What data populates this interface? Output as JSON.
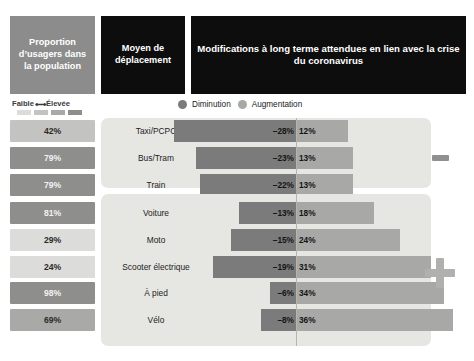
{
  "header": {
    "proportion_title": "Proportion d’usagers dans la population",
    "mode_title": "Moyen de déplacement",
    "modifications_title": "Modifications à long terme attendues en lien avec la crise du coronavirus"
  },
  "legend": {
    "scale_low": "Faible",
    "scale_arrow": "⟷",
    "scale_high": "Élevée",
    "scale_swatches": [
      "#dcdcda",
      "#c3c3c1",
      "#a9a9a7",
      "#8e8e8c"
    ],
    "series": [
      {
        "label": "Diminution",
        "color": "#7b7b7b",
        "icon": "circle-icon"
      },
      {
        "label": "Augmentation",
        "color": "#a8a8a6",
        "icon": "circle-icon"
      }
    ]
  },
  "markers": {
    "decrease_symbol": "minus-icon",
    "increase_symbol": "plus-icon"
  },
  "colors": {
    "header_proportion_bg": "#8c8c8c",
    "header_dark_bg": "#0d0d0d",
    "card_bg": "#e6e6e3",
    "negative_bar": "#7b7b7b",
    "positive_bar": "#a8a8a6",
    "axis": "#b7b4ae"
  },
  "chart_data": {
    "type": "bar",
    "title": "Modifications à long terme attendues en lien avec la crise du coronavirus",
    "xlabel": "",
    "ylabel": "Moyen de déplacement",
    "orientation": "horizontal-diverging",
    "grid": false,
    "legend_position": "top",
    "axis_center": 0,
    "units": "%",
    "series": [
      {
        "name": "Diminution",
        "color": "#7b7b7b",
        "values": [
          -28,
          -23,
          -22,
          -13,
          -15,
          -19,
          -6,
          -8
        ]
      },
      {
        "name": "Augmentation",
        "color": "#a8a8a6",
        "values": [
          12,
          13,
          13,
          18,
          24,
          31,
          34,
          36
        ]
      }
    ],
    "categories": [
      "Taxi/PCPC",
      "Bus/Tram",
      "Train",
      "Voiture",
      "Moto",
      "Scooter électrique",
      "À pied",
      "Vélo"
    ],
    "proportion_series": {
      "name": "Proportion d’usagers dans la population",
      "values": [
        42,
        79,
        79,
        81,
        29,
        24,
        98,
        69
      ]
    }
  },
  "groups": [
    {
      "id": "group-decrease-dominant",
      "rows": [
        {
          "mode": "Taxi/PCPC",
          "proportion": "42%",
          "prop_value": 42,
          "neg": "–28%",
          "neg_value": -28,
          "pos": "12%",
          "pos_value": 12
        },
        {
          "mode": "Bus/Tram",
          "proportion": "79%",
          "prop_value": 79,
          "neg": "–23%",
          "neg_value": -23,
          "pos": "13%",
          "pos_value": 13
        },
        {
          "mode": "Train",
          "proportion": "79%",
          "prop_value": 79,
          "neg": "–22%",
          "neg_value": -22,
          "pos": "13%",
          "pos_value": 13
        }
      ]
    },
    {
      "id": "group-increase-dominant",
      "rows": [
        {
          "mode": "Voiture",
          "proportion": "81%",
          "prop_value": 81,
          "neg": "–13%",
          "neg_value": -13,
          "pos": "18%",
          "pos_value": 18
        },
        {
          "mode": "Moto",
          "proportion": "29%",
          "prop_value": 29,
          "neg": "–15%",
          "neg_value": -15,
          "pos": "24%",
          "pos_value": 24
        },
        {
          "mode": "Scooter électrique",
          "proportion": "24%",
          "prop_value": 24,
          "neg": "–19%",
          "neg_value": -19,
          "pos": "31%",
          "pos_value": 31
        },
        {
          "mode": "À pied",
          "proportion": "98%",
          "prop_value": 98,
          "neg": "–6%",
          "neg_value": -6,
          "pos": "34%",
          "pos_value": 34
        },
        {
          "mode": "Vélo",
          "proportion": "69%",
          "prop_value": 69,
          "neg": "–8%",
          "neg_value": -8,
          "pos": "36%",
          "pos_value": 36
        }
      ]
    }
  ]
}
